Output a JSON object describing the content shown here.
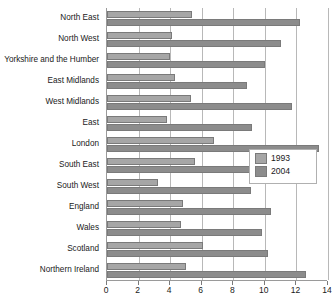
{
  "chart_data": {
    "type": "bar",
    "orientation": "horizontal",
    "title": "",
    "xlabel": "",
    "ylabel": "",
    "xlim": [
      0,
      14
    ],
    "xticks": [
      0,
      2,
      4,
      6,
      8,
      10,
      12,
      14
    ],
    "grid": true,
    "legend_position": "middle-right",
    "categories": [
      "North East",
      "North West",
      "Yorkshire and the Humber",
      "East Midlands",
      "West Midlands",
      "East",
      "London",
      "South East",
      "South West",
      "England",
      "Wales",
      "Scotland",
      "Northern Ireland"
    ],
    "series": [
      {
        "name": "1993",
        "color": "#a6a6a6",
        "values": [
          5.4,
          4.1,
          4.0,
          4.3,
          5.3,
          3.8,
          6.8,
          5.6,
          3.2,
          4.8,
          4.7,
          6.1,
          5.0
        ]
      },
      {
        "name": "2004",
        "color": "#8c8c8c",
        "values": [
          12.2,
          11.0,
          10.0,
          8.9,
          11.7,
          9.2,
          13.4,
          9.7,
          9.1,
          10.4,
          9.8,
          10.2,
          12.6
        ]
      }
    ]
  },
  "legend": {
    "items": [
      {
        "label": "1993"
      },
      {
        "label": "2004"
      }
    ]
  }
}
